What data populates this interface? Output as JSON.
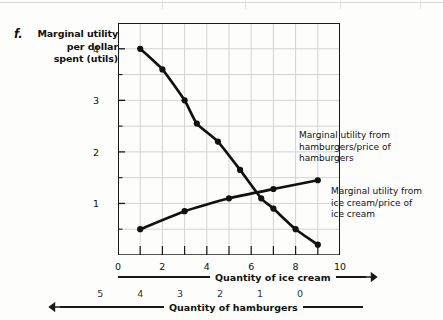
{
  "figure": {
    "item_letter": "f.",
    "y_axis_caption": "Marginal utility\nper dollar\nspent (utils)"
  },
  "annotations": {
    "hamburgers": "Marginal utility from\nhamburgers/price of\nhamburgers",
    "ice_cream": "Marginal utility from\nice cream/price of\nice cream"
  },
  "axis_titles": {
    "primary": "Quantity of ice cream",
    "secondary": "Quantity of hamburgers"
  },
  "colors": {
    "curve": "#111111",
    "frame": "#1a1a1a",
    "grid": "#d2d2d2",
    "background": "#fdfdfc"
  },
  "chart_data": {
    "type": "line",
    "title": "",
    "xlabel": "Quantity of ice cream",
    "ylabel": "Marginal utility per dollar spent (utils)",
    "xlim": [
      0,
      10
    ],
    "ylim": [
      0,
      4.5
    ],
    "grid": true,
    "legend": "annotations",
    "x_ticks": [
      0,
      2,
      4,
      6,
      8,
      10
    ],
    "x_tick_labels": [
      "0",
      "2",
      "4",
      "6",
      "8",
      "10"
    ],
    "x_minor_ticks": [
      1,
      3,
      5,
      7,
      9
    ],
    "y_ticks": [
      1,
      2,
      3,
      4
    ],
    "y_tick_labels": [
      "1",
      "2",
      "3",
      "4"
    ],
    "y_minor_ticks": [
      0.5,
      1.5,
      2.5,
      3.5
    ],
    "secondary_xlabel": "Quantity of hamburgers",
    "secondary_x_tick_labels": [
      "5",
      "4",
      "3",
      "2",
      "1",
      "0"
    ],
    "secondary_x_tick_values": [
      1,
      2.8,
      4.6,
      6.4,
      8.2,
      10
    ],
    "secondary_direction": "reversed",
    "series": [
      {
        "name": "Marginal utility from ice cream/price of ice cream",
        "points": [
          [
            1,
            4.0
          ],
          [
            2,
            3.6
          ],
          [
            3,
            3.0
          ],
          [
            3.55,
            2.55
          ],
          [
            4.5,
            2.2
          ],
          [
            5.5,
            1.65
          ],
          [
            6.45,
            1.1
          ],
          [
            7.0,
            0.9
          ],
          [
            8.0,
            0.5
          ],
          [
            9.0,
            0.2
          ]
        ]
      },
      {
        "name": "Marginal utility from hamburgers/price of hamburgers",
        "points": [
          [
            1,
            0.5
          ],
          [
            3,
            0.85
          ],
          [
            5,
            1.1
          ],
          [
            7,
            1.28
          ],
          [
            9,
            1.45
          ]
        ]
      }
    ]
  }
}
